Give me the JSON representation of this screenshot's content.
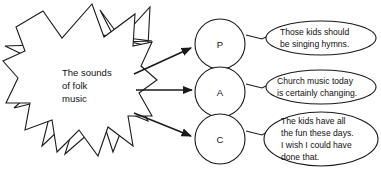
{
  "diagram": {
    "type": "concept-flow",
    "burst": {
      "label_lines": [
        "The sounds",
        "of folk",
        "music"
      ],
      "shape": "starburst",
      "outline_color": "#1a1a1a",
      "fill_color": "#ffffff"
    },
    "nodes": [
      {
        "id": "p",
        "label": "P",
        "shape": "circle"
      },
      {
        "id": "a",
        "label": "A",
        "shape": "circle"
      },
      {
        "id": "c",
        "label": "C",
        "shape": "circle"
      }
    ],
    "callouts": [
      {
        "id": "callout-p",
        "for_node": "P",
        "lines": [
          "Those kids should",
          "be singing hymns."
        ]
      },
      {
        "id": "callout-a",
        "for_node": "A",
        "lines": [
          "Church music today",
          "is certainly changing."
        ]
      },
      {
        "id": "callout-c",
        "for_node": "C",
        "lines": [
          "The kids have all",
          "the fun these days.",
          "I wish I could have",
          "done that."
        ]
      }
    ],
    "connectors": [
      {
        "from": "burst",
        "to": "P",
        "style": "arrow"
      },
      {
        "from": "burst",
        "to": "A",
        "style": "arrow"
      },
      {
        "from": "burst",
        "to": "C",
        "style": "arrow"
      }
    ]
  }
}
